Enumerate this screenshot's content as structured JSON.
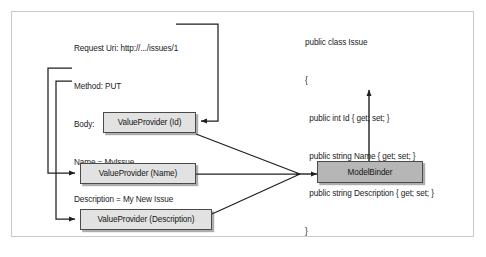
{
  "diagram": {
    "frame_border_color": "#c9c9c9",
    "background": "#ffffff"
  },
  "request": {
    "lines": [
      "Request Uri: http://.../issues/1",
      "Method: PUT",
      "Body:",
      "Name = MyIssue",
      "Description = My New Issue"
    ],
    "uri_line": "Request Uri: http://.../issues/1",
    "method_line": "Method: PUT",
    "body_line": "Body:",
    "name_line": "Name = MyIssue",
    "description_line": "Description = My New Issue"
  },
  "code": {
    "lines": [
      "public class Issue",
      "{",
      "  public int Id { get; set; }",
      "  public string Name { get; set; }",
      "  public string Description { get; set; }",
      "}"
    ],
    "line_0": "public class Issue",
    "line_1": "{",
    "line_2": "  public int Id { get; set; }",
    "line_3": "  public string Name { get; set; }",
    "line_4": "  public string Description { get; set; }",
    "line_5": "}"
  },
  "nodes": {
    "value_provider_id": {
      "label": "ValueProvider (Id)",
      "fill": "#e2e2e2",
      "stroke": "#4a4a4a"
    },
    "value_provider_name": {
      "label": "ValueProvider (Name)",
      "fill": "#e2e2e2",
      "stroke": "#4a4a4a"
    },
    "value_provider_description": {
      "label": "ValueProvider (Description)",
      "fill": "#e2e2e2",
      "stroke": "#4a4a4a"
    },
    "model_binder": {
      "label": "ModelBinder",
      "fill": "#b6b6b6",
      "stroke": "#4a4a4a"
    }
  },
  "connectors": {
    "uri_to_id": "Request Uri routes right then down into ValueProvider (Id)",
    "name_to_name_provider": "Name line routes left then down into ValueProvider (Name)",
    "description_to_description_provider": "Description line routes left then down into ValueProvider (Description)",
    "id_to_binder": "ValueProvider (Id) to ModelBinder",
    "name_to_binder": "ValueProvider (Name) to ModelBinder",
    "description_to_binder": "ValueProvider (Description) to ModelBinder",
    "binder_to_class": "ModelBinder up to Issue class",
    "line_color": "#1f1f1f"
  }
}
